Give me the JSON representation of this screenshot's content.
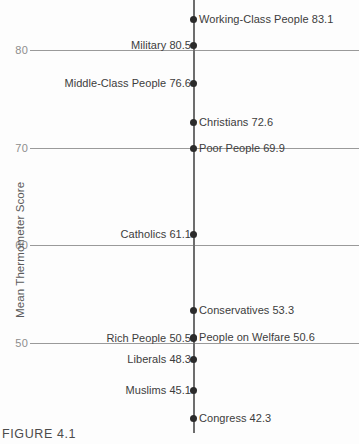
{
  "figure": {
    "caption": "FIGURE 4.1"
  },
  "chart_data": {
    "type": "scatter",
    "title": "",
    "subtitle": "",
    "xlabel": "",
    "ylabel": "Mean Thermometer Score",
    "ylim": [
      40,
      85
    ],
    "grid": true,
    "legend": "none",
    "orientation": "vertical-dotplot",
    "yticks": [
      80,
      70,
      60,
      50
    ],
    "ytick_labels": [
      "80",
      "70",
      "60",
      "50"
    ],
    "categories": [
      "Working-Class People",
      "Military",
      "Middle-Class People",
      "Christians",
      "Poor People",
      "Catholics",
      "Conservatives",
      "Rich People",
      "People on Welfare",
      "Liberals",
      "Muslims",
      "Congress"
    ],
    "values": [
      83.1,
      80.5,
      76.6,
      72.6,
      69.9,
      61.1,
      53.3,
      50.5,
      50.6,
      48.3,
      45.1,
      42.3
    ],
    "points": [
      {
        "label": "Working-Class People 83.1",
        "name": "Working-Class People",
        "value": 83.1,
        "side": "right"
      },
      {
        "label": "Military 80.5",
        "name": "Military",
        "value": 80.5,
        "side": "left"
      },
      {
        "label": "Middle-Class People 76.6",
        "name": "Middle-Class People",
        "value": 76.6,
        "side": "left"
      },
      {
        "label": "Christians 72.6",
        "name": "Christians",
        "value": 72.6,
        "side": "right"
      },
      {
        "label": "Poor People 69.9",
        "name": "Poor People",
        "value": 69.9,
        "side": "right"
      },
      {
        "label": "Catholics 61.1",
        "name": "Catholics",
        "value": 61.1,
        "side": "left"
      },
      {
        "label": "Conservatives 53.3",
        "name": "Conservatives",
        "value": 53.3,
        "side": "right"
      },
      {
        "label": "Rich People 50.5",
        "name": "Rich People",
        "value": 50.5,
        "side": "left"
      },
      {
        "label": "People on Welfare 50.6",
        "name": "People on Welfare",
        "value": 50.6,
        "side": "right"
      },
      {
        "label": "Liberals 48.3",
        "name": "Liberals",
        "value": 48.3,
        "side": "left"
      },
      {
        "label": "Muslims 45.1",
        "name": "Muslims",
        "value": 45.1,
        "side": "left"
      },
      {
        "label": "Congress 42.3",
        "name": "Congress",
        "value": 42.3,
        "side": "right"
      }
    ],
    "colors": {
      "dot": "#2b2b2b",
      "axis": "#6d6d6d",
      "gridline": "#9a9a9a",
      "tick_text": "#8d8d8d",
      "label_text": "#3c3c3c",
      "background": "#fdfdfd"
    }
  }
}
